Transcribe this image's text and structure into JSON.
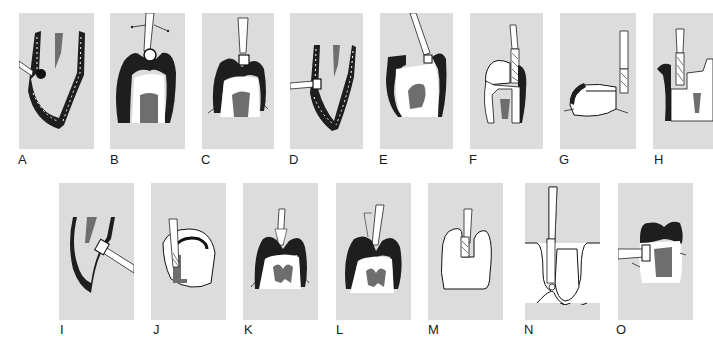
{
  "figure": {
    "colors": {
      "panel_background": "#dcdcdc",
      "enamel": "#1e1e1e",
      "pulp": "#6e6e6e",
      "dentin": "#ffffff",
      "label": "#1a1a1a"
    },
    "panels": [
      {
        "label": "A",
        "x": 19,
        "y": 13,
        "w": 75,
        "h": 136
      },
      {
        "label": "B",
        "x": 110,
        "y": 13,
        "w": 75,
        "h": 136
      },
      {
        "label": "C",
        "x": 202,
        "y": 13,
        "w": 72,
        "h": 136
      },
      {
        "label": "D",
        "x": 290,
        "y": 13,
        "w": 73,
        "h": 136
      },
      {
        "label": "E",
        "x": 380,
        "y": 13,
        "w": 73,
        "h": 136
      },
      {
        "label": "F",
        "x": 470,
        "y": 13,
        "w": 73,
        "h": 136
      },
      {
        "label": "G",
        "x": 560,
        "y": 13,
        "w": 76,
        "h": 136
      },
      {
        "label": "H",
        "x": 653,
        "y": 13,
        "w": 60,
        "h": 136
      },
      {
        "label": "I",
        "x": 59,
        "y": 183,
        "w": 75,
        "h": 137
      },
      {
        "label": "J",
        "x": 151,
        "y": 183,
        "w": 75,
        "h": 137
      },
      {
        "label": "K",
        "x": 243,
        "y": 183,
        "w": 75,
        "h": 137
      },
      {
        "label": "L",
        "x": 336,
        "y": 183,
        "w": 75,
        "h": 137
      },
      {
        "label": "M",
        "x": 428,
        "y": 183,
        "w": 75,
        "h": 137
      },
      {
        "label": "N",
        "x": 525,
        "y": 183,
        "w": 75,
        "h": 137
      },
      {
        "label": "O",
        "x": 618,
        "y": 183,
        "w": 75,
        "h": 137
      }
    ]
  }
}
